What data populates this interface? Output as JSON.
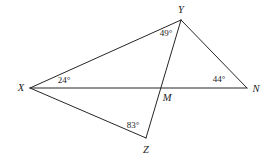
{
  "figure": {
    "type": "geometry-diagram",
    "background_color": "#ffffff",
    "line_color": "#262626",
    "line_width": 1,
    "points": {
      "X": {
        "x": 30,
        "y": 88,
        "label": "X",
        "label_x": 21,
        "label_y": 88
      },
      "Y": {
        "x": 181,
        "y": 20,
        "label": "Y",
        "label_x": 181,
        "label_y": 10
      },
      "N": {
        "x": 247,
        "y": 88,
        "label": "N",
        "label_x": 256,
        "label_y": 89
      },
      "M": {
        "x": 167,
        "y": 88,
        "label": "M",
        "label_x": 167,
        "label_y": 98
      },
      "Z": {
        "x": 146,
        "y": 138,
        "label": "Z",
        "label_x": 146,
        "label_y": 150
      }
    },
    "segments": [
      {
        "name": "segment-XY",
        "from": "X",
        "to": "Y"
      },
      {
        "name": "segment-YN",
        "from": "Y",
        "to": "N"
      },
      {
        "name": "segment-XN",
        "from": "X",
        "to": "N"
      },
      {
        "name": "segment-YZ",
        "from": "Y",
        "to": "Z"
      },
      {
        "name": "segment-XZ",
        "from": "X",
        "to": "Z"
      }
    ],
    "angles": [
      {
        "name": "angle-at-X",
        "vertex": "X",
        "value": "24°",
        "label_x": 64,
        "label_y": 80
      },
      {
        "name": "angle-at-Y",
        "vertex": "Y",
        "value": "49°",
        "label_x": 166,
        "label_y": 33
      },
      {
        "name": "angle-at-N",
        "vertex": "N",
        "value": "44°",
        "label_x": 219,
        "label_y": 79
      },
      {
        "name": "angle-at-Z",
        "vertex": "Z",
        "value": "83°",
        "label_x": 133,
        "label_y": 125
      }
    ]
  }
}
